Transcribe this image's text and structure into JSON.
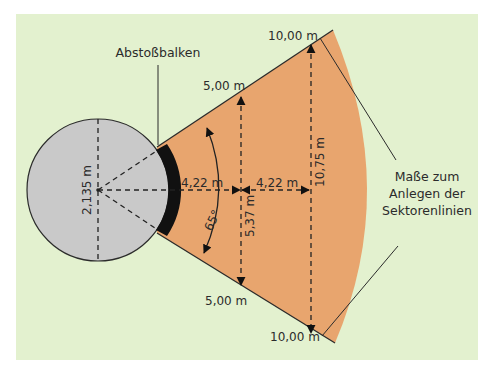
{
  "title_label": "Abstoßbalken",
  "colors": {
    "background": "#e3f1cf",
    "circle_fill": "#c9c9c9",
    "sector_fill": "#e8a56e",
    "beam": "#111111",
    "line": "#2b2b2b"
  },
  "labels": {
    "upper_5m": "5,00 m",
    "upper_10m": "10,00 m",
    "lower_5m": "5,00 m",
    "lower_10m": "10,00 m",
    "diameter": "2,135 m",
    "dist_a": "4,22 m",
    "dist_b": "4,22 m",
    "chord_5m": "5,37 m",
    "chord_10m": "10,75 m",
    "angle": "65°"
  },
  "side_note": {
    "line1": "Maße zum",
    "line2": "Anlegen der",
    "line3": "Sektorenlinien"
  }
}
